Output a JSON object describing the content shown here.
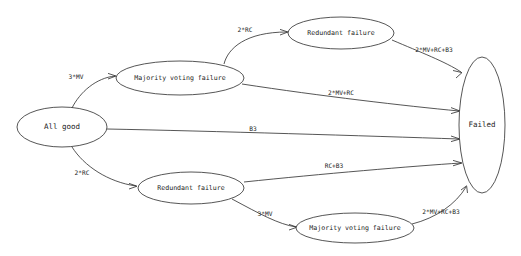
{
  "diagram": {
    "type": "state-transition-diagram",
    "background_color": "#ffffff",
    "stroke_color": "#2b2b2b",
    "text_color": "#1a1a1a",
    "nodes": [
      {
        "id": "all-good",
        "label": "All good",
        "cx": 62,
        "cy": 127,
        "rx": 45,
        "ry": 20,
        "font_size": 7.5
      },
      {
        "id": "mv-failure-top",
        "label": "Majority voting failure",
        "cx": 180,
        "cy": 78,
        "rx": 64,
        "ry": 17,
        "font_size": 6.6
      },
      {
        "id": "redundant-top",
        "label": "Redundant failure",
        "cx": 341,
        "cy": 33,
        "rx": 53,
        "ry": 16,
        "font_size": 6.6
      },
      {
        "id": "redundant-bottom",
        "label": "Redundant failure",
        "cx": 191,
        "cy": 188,
        "rx": 53,
        "ry": 16,
        "font_size": 6.6
      },
      {
        "id": "mv-failure-bottom",
        "label": "Majority voting failure",
        "cx": 355,
        "cy": 228,
        "rx": 59,
        "ry": 15,
        "font_size": 6.6
      },
      {
        "id": "failed",
        "label": "Failed",
        "cx": 482,
        "cy": 125,
        "rx": 23,
        "ry": 68,
        "font_size": 7.5
      }
    ],
    "edges": [
      {
        "id": "e-allgood-mv-top",
        "label": "3*MV",
        "from": "all-good",
        "to": "mv-failure-top",
        "label_x": 76,
        "label_y": 77,
        "font_size": 6.2
      },
      {
        "id": "e-mv-top-redundant-top",
        "label": "2*RC",
        "from": "mv-failure-top",
        "to": "redundant-top",
        "label_x": 245,
        "label_y": 30,
        "font_size": 6.2
      },
      {
        "id": "e-redundant-top-failed",
        "label": "2*MV+RC+B3",
        "from": "redundant-top",
        "to": "failed",
        "label_x": 434,
        "label_y": 50,
        "font_size": 6.2
      },
      {
        "id": "e-mv-top-failed",
        "label": "2*MV+RC",
        "from": "mv-failure-top",
        "to": "failed",
        "label_x": 341,
        "label_y": 93,
        "font_size": 6.2
      },
      {
        "id": "e-allgood-failed",
        "label": "B3",
        "from": "all-good",
        "to": "failed",
        "label_x": 253,
        "label_y": 129,
        "font_size": 6.2
      },
      {
        "id": "e-allgood-redundant-bot",
        "label": "2*RC",
        "from": "all-good",
        "to": "redundant-bottom",
        "label_x": 82,
        "label_y": 173,
        "font_size": 6.2
      },
      {
        "id": "e-redundant-bot-failed",
        "label": "RC+B3",
        "from": "redundant-bottom",
        "to": "failed",
        "label_x": 334,
        "label_y": 166,
        "font_size": 6.2
      },
      {
        "id": "e-redundant-bot-mv-bot",
        "label": "3*MV",
        "from": "redundant-bottom",
        "to": "mv-failure-bottom",
        "label_x": 265,
        "label_y": 214,
        "font_size": 6.2
      },
      {
        "id": "e-mv-bot-failed",
        "label": "2*MV+RC+B3",
        "from": "mv-failure-bottom",
        "to": "failed",
        "label_x": 441,
        "label_y": 212,
        "font_size": 6.2
      }
    ]
  }
}
